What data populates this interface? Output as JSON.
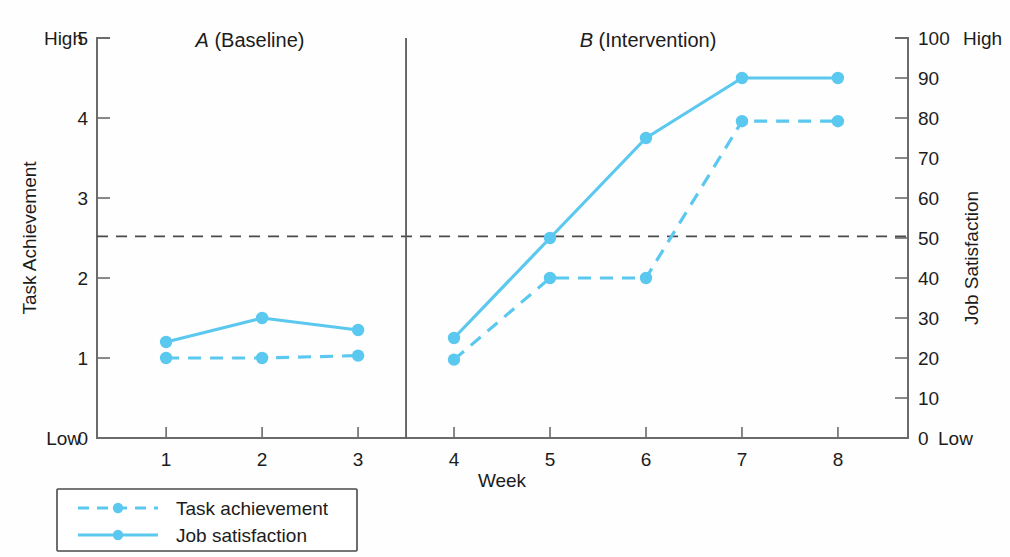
{
  "chart_data": {
    "type": "line",
    "title": "",
    "xlabel": "Week",
    "ylabel": "Task Achievement",
    "y2label": "Job Satisfaction",
    "x": [
      1,
      2,
      3,
      4,
      5,
      6,
      7,
      8
    ],
    "xtick_labels": [
      "1",
      "2",
      "3",
      "4",
      "5",
      "6",
      "7",
      "8"
    ],
    "ylim": [
      0,
      5
    ],
    "ytick_labels": [
      "0",
      "1",
      "2",
      "3",
      "4",
      "5"
    ],
    "ytick_values": [
      0,
      1,
      2,
      3,
      4,
      5
    ],
    "y_low_label": "Low",
    "y_high_label": "High",
    "y2lim": [
      0,
      100
    ],
    "y2tick_labels": [
      "0",
      "10",
      "20",
      "30",
      "40",
      "50",
      "60",
      "70",
      "80",
      "90",
      "100"
    ],
    "y2tick_values": [
      0,
      10,
      20,
      30,
      40,
      50,
      60,
      70,
      80,
      90,
      100
    ],
    "y2_low_label": "Low",
    "y2_high_label": "High",
    "grid": false,
    "legend_position": "below-left",
    "series": [
      {
        "name": "Task achievement",
        "style": "dashed",
        "axis": "left",
        "color": "#5BC8EF",
        "values": [
          1.0,
          1.0,
          1.03,
          0.98,
          2.0,
          2.0,
          3.96,
          3.96
        ]
      },
      {
        "name": "Job satisfaction",
        "style": "solid",
        "axis": "right",
        "color": "#5BC8EF",
        "values_left_scale": [
          1.22,
          1.49,
          1.35,
          1.26,
          2.5,
          3.73,
          4.48,
          4.48
        ],
        "values": [
          24,
          30,
          27,
          25,
          50,
          75,
          90,
          90
        ]
      }
    ],
    "phases": [
      {
        "letter": "A",
        "name": "(Baseline)",
        "weeks": [
          1,
          2,
          3
        ]
      },
      {
        "letter": "B",
        "name": "(Intervention)",
        "weeks": [
          4,
          5,
          6,
          7,
          8
        ]
      }
    ],
    "phase_divider_x": 3.5,
    "annotations": [
      {
        "type": "hline",
        "label": "criterion line",
        "value_left": 2.52,
        "value_right": 50
      }
    ],
    "colors": {
      "series": "#5BC8EF",
      "axis": "#6b6b6b",
      "reference_line": "#4a4a4a",
      "text": "#1c1c1c"
    }
  },
  "legend": {
    "items": [
      {
        "label": "Task achievement",
        "style": "dashed"
      },
      {
        "label": "Job satisfaction",
        "style": "solid"
      }
    ]
  }
}
